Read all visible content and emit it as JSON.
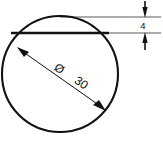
{
  "drawing": {
    "title": "Circular section with chord offset dimension",
    "type": "engineering-dimension-drawing",
    "background_color": "#ffffff",
    "line_color": "#111111",
    "canvas": {
      "width": 163,
      "height": 145
    },
    "circle": {
      "label": "outer-circle",
      "center_x": 60,
      "center_y": 74,
      "radius": 58,
      "stroke_width": 2.1
    },
    "chord": {
      "label": "chord-line",
      "y": 33,
      "x1": 11,
      "x2": 109,
      "stroke_width": 2.6
    },
    "extension_lines": [
      {
        "name": "upper-extension-line",
        "x1": 60,
        "y1": 17,
        "x2": 161,
        "y2": 17,
        "stroke_width": 0.7
      },
      {
        "name": "lower-extension-line",
        "x1": 100,
        "y1": 33,
        "x2": 161,
        "y2": 33,
        "stroke_width": 0.7
      }
    ],
    "dimensions": [
      {
        "id": "thickness-dimension",
        "value": "4",
        "unit": "mm",
        "orientation": "vertical",
        "style": "outside-arrows",
        "text_x": 143,
        "text_y": 29,
        "font_size": 9,
        "arrow_x": 145,
        "top_tip_y": 17,
        "top_tail_y": 1,
        "bottom_tip_y": 33,
        "bottom_tail_y": 49
      },
      {
        "id": "diameter-dimension",
        "symbol": "Ø",
        "value": "30",
        "unit": "mm",
        "orientation": "diagonal",
        "style": "inside-arrows",
        "x1": 18,
        "y1": 48,
        "x2": 104,
        "y2": 109,
        "rotation_deg": 35,
        "symbol_x": 57,
        "symbol_y": 71,
        "value_x": 76,
        "value_y": 84,
        "font_size": 11,
        "stroke_width": 1.0
      }
    ]
  }
}
